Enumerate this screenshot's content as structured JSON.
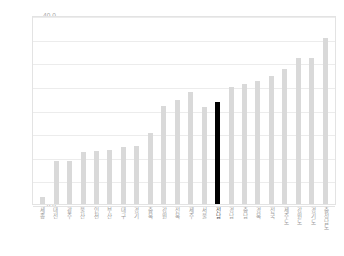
{
  "chart_data": {
    "type": "bar",
    "title": "",
    "subtitle": "",
    "xlabel": "",
    "ylabel": "",
    "ylim": [
      0.0,
      40.0
    ],
    "ytick_step": 5.0,
    "yticks": [
      "40.0",
      "35.0",
      "30.0",
      "25.0",
      "20.0",
      "15.0",
      "10.0",
      "5.0",
      "0.0"
    ],
    "ytick_values": [
      40.0,
      35.0,
      30.0,
      25.0,
      20.0,
      15.0,
      10.0,
      5.0,
      0.0
    ],
    "grid": "horizontal",
    "legend": "none",
    "bar_color": "#d9d9d9",
    "highlight_color": "#000000",
    "highlight_index": 13,
    "categories": [
      "세종",
      "대전",
      "광주",
      "울산",
      "인천",
      "부산",
      "대구",
      "경기",
      "충북",
      "강원",
      "전북",
      "제주",
      "서울",
      "전남",
      "경남",
      "충남",
      "경북",
      "전국",
      "제주도",
      "강원도",
      "경기도",
      "충청남도"
    ],
    "values": [
      1.5,
      9.0,
      9.0,
      11.0,
      11.3,
      11.5,
      12.0,
      12.2,
      15.0,
      20.8,
      22.0,
      23.7,
      20.5,
      21.5,
      24.8,
      25.5,
      26.0,
      27.0,
      28.5,
      30.8,
      31.0,
      35.2
    ]
  }
}
